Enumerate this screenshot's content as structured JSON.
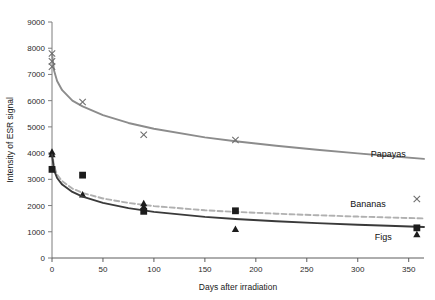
{
  "chart_data": {
    "type": "scatter",
    "title": "",
    "subtitle": "",
    "xlabel": "Days after irradiation",
    "ylabel": "Intensity of ESR signal",
    "xlim": [
      0,
      365
    ],
    "ylim": [
      0,
      9000
    ],
    "xticks": [
      0,
      50,
      100,
      150,
      200,
      250,
      300,
      350
    ],
    "yticks": [
      0,
      1000,
      2000,
      3000,
      4000,
      5000,
      6000,
      7000,
      8000,
      9000
    ],
    "xtick_labels": [
      "0",
      "50",
      "100",
      "150",
      "200",
      "250",
      "300",
      "350"
    ],
    "ytick_labels": [
      "0",
      "1000",
      "2000",
      "3000",
      "4000",
      "5000",
      "6000",
      "7000",
      "8000",
      "9000"
    ],
    "grid": false,
    "legend_position": "inline-right-of-curves",
    "series": [
      {
        "name": "Papayas",
        "label": "Papayas",
        "marker": "x",
        "line_style": "solid",
        "color": "#8c8c8c",
        "label_x": 330,
        "label_y": 3850,
        "points": [
          {
            "x": 0,
            "y": 7800
          },
          {
            "x": 0,
            "y": 7500
          },
          {
            "x": 0,
            "y": 7300
          },
          {
            "x": 30,
            "y": 5950
          },
          {
            "x": 90,
            "y": 4700
          },
          {
            "x": 180,
            "y": 4500
          },
          {
            "x": 358,
            "y": 2250
          }
        ],
        "fit_curve": [
          {
            "x": 0,
            "y": 7800
          },
          {
            "x": 2,
            "y": 7150
          },
          {
            "x": 5,
            "y": 6750
          },
          {
            "x": 10,
            "y": 6400
          },
          {
            "x": 20,
            "y": 6000
          },
          {
            "x": 30,
            "y": 5780
          },
          {
            "x": 50,
            "y": 5450
          },
          {
            "x": 75,
            "y": 5150
          },
          {
            "x": 100,
            "y": 4930
          },
          {
            "x": 150,
            "y": 4600
          },
          {
            "x": 180,
            "y": 4450
          },
          {
            "x": 220,
            "y": 4280
          },
          {
            "x": 260,
            "y": 4130
          },
          {
            "x": 300,
            "y": 3990
          },
          {
            "x": 330,
            "y": 3890
          },
          {
            "x": 365,
            "y": 3780
          }
        ]
      },
      {
        "name": "Bananas",
        "label": "Bananas",
        "marker": "triangle",
        "line_style": "dashed",
        "color": "#b0b0b0",
        "label_x": 310,
        "label_y": 1950,
        "points": [
          {
            "x": 0,
            "y": 4050
          },
          {
            "x": 0,
            "y": 3950
          },
          {
            "x": 30,
            "y": 2420
          },
          {
            "x": 90,
            "y": 2080
          },
          {
            "x": 90,
            "y": 1960
          },
          {
            "x": 180,
            "y": 1100
          },
          {
            "x": 358,
            "y": 900
          }
        ],
        "fit_curve": [
          {
            "x": 0,
            "y": 4050
          },
          {
            "x": 2,
            "y": 3500
          },
          {
            "x": 5,
            "y": 3180
          },
          {
            "x": 10,
            "y": 2930
          },
          {
            "x": 20,
            "y": 2650
          },
          {
            "x": 30,
            "y": 2480
          },
          {
            "x": 50,
            "y": 2270
          },
          {
            "x": 75,
            "y": 2100
          },
          {
            "x": 100,
            "y": 1980
          },
          {
            "x": 150,
            "y": 1820
          },
          {
            "x": 180,
            "y": 1760
          },
          {
            "x": 220,
            "y": 1690
          },
          {
            "x": 260,
            "y": 1630
          },
          {
            "x": 300,
            "y": 1580
          },
          {
            "x": 330,
            "y": 1545
          },
          {
            "x": 365,
            "y": 1510
          }
        ]
      },
      {
        "name": "Figs",
        "label": "Figs",
        "marker": "square",
        "line_style": "solid",
        "color": "#3a3a3a",
        "label_x": 325,
        "label_y": 700,
        "points": [
          {
            "x": 0,
            "y": 3380
          },
          {
            "x": 30,
            "y": 3160
          },
          {
            "x": 90,
            "y": 1780
          },
          {
            "x": 180,
            "y": 1800
          },
          {
            "x": 358,
            "y": 1150
          }
        ],
        "fit_curve": [
          {
            "x": 0,
            "y": 3950
          },
          {
            "x": 2,
            "y": 3350
          },
          {
            "x": 5,
            "y": 3050
          },
          {
            "x": 10,
            "y": 2800
          },
          {
            "x": 20,
            "y": 2520
          },
          {
            "x": 30,
            "y": 2340
          },
          {
            "x": 50,
            "y": 2100
          },
          {
            "x": 75,
            "y": 1900
          },
          {
            "x": 100,
            "y": 1760
          },
          {
            "x": 150,
            "y": 1570
          },
          {
            "x": 180,
            "y": 1490
          },
          {
            "x": 220,
            "y": 1400
          },
          {
            "x": 260,
            "y": 1330
          },
          {
            "x": 300,
            "y": 1270
          },
          {
            "x": 330,
            "y": 1230
          },
          {
            "x": 365,
            "y": 1180
          }
        ]
      }
    ]
  },
  "axes": {
    "x_axis_title": "Days after irradiation",
    "y_axis_title": "Intensity of ESR signal"
  },
  "labels": {
    "papayas": "Papayas",
    "bananas": "Bananas",
    "figs": "Figs"
  }
}
